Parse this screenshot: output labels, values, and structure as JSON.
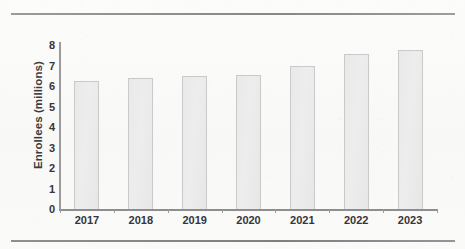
{
  "figure": {
    "has_top_rule": true,
    "has_bottom_rule": true,
    "rule_color": "#8d8d8f"
  },
  "chart_data": {
    "type": "bar",
    "title": "",
    "xlabel": "",
    "ylabel": "Enrollees (millions)",
    "categories": [
      "2017",
      "2018",
      "2019",
      "2020",
      "2021",
      "2022",
      "2023"
    ],
    "values": [
      6.25,
      6.4,
      6.5,
      6.55,
      7.0,
      7.55,
      7.75
    ],
    "ytick_labels": [
      "8",
      "7",
      "6",
      "5",
      "4",
      "3",
      "2",
      "1",
      "0"
    ],
    "yticks": [
      8,
      7,
      6,
      5,
      4,
      3,
      2,
      1,
      0
    ],
    "ylim": [
      0,
      8
    ],
    "grid": false,
    "legend": null,
    "bar_fill_color": "#ebebeb",
    "bar_border_color": "#c9c9c9",
    "axis_color": "#9b9b9d",
    "text_color": "#35353a"
  }
}
